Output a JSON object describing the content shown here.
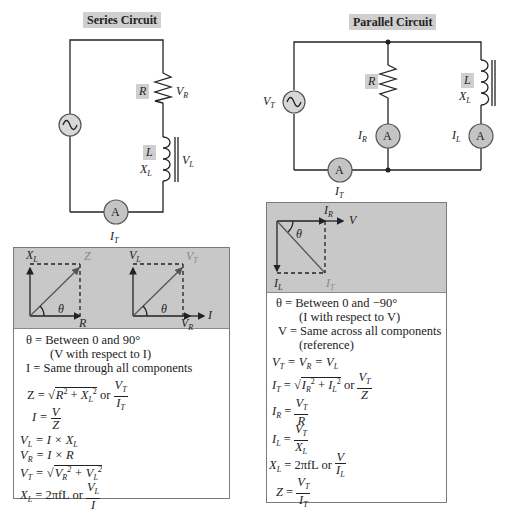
{
  "series": {
    "title": "Series Circuit",
    "labels": {
      "R": "R",
      "VR": "V",
      "VR_sub": "R",
      "L": "L",
      "XL": "X",
      "XL_sub": "L",
      "VL": "V",
      "VL_sub": "L",
      "ammeter": "A",
      "IT": "I",
      "IT_sub": "T"
    },
    "phasor_impedance": {
      "y_axis": "X",
      "y_axis_sub": "L",
      "x_axis": "R",
      "resultant": "Z",
      "angle": "θ"
    },
    "phasor_voltage": {
      "y_axis": "V",
      "y_axis_sub": "L",
      "x_axis": "V",
      "x_axis_sub": "R",
      "resultant": "V",
      "resultant_sub": "T",
      "reference": "I",
      "angle": "θ"
    },
    "equations": {
      "theta": "θ = Between 0 and 90°",
      "theta_note": "(V with respect to I)",
      "current": "I = Same through all components",
      "z_lhs": "Z =",
      "z_or": "or",
      "i_lhs": "I =",
      "vl": "V",
      "vr": "V",
      "vt_lhs": "V",
      "xl_lhs": "X",
      "xl_rhs": "= 2πfL or"
    }
  },
  "parallel": {
    "title": "Parallel Circuit",
    "labels": {
      "VT": "V",
      "VT_sub": "T",
      "R": "R",
      "IR": "I",
      "IR_sub": "R",
      "L": "L",
      "XL": "X",
      "XL_sub": "L",
      "IL": "I",
      "IL_sub": "L",
      "IT": "I",
      "IT_sub": "T",
      "ammeter": "A"
    },
    "phasor": {
      "reference": "V",
      "x_component": "I",
      "x_component_sub": "R",
      "y_component": "I",
      "y_component_sub": "L",
      "resultant": "I",
      "resultant_sub": "T",
      "angle": "θ"
    },
    "equations": {
      "theta": "θ = Between 0 and −90°",
      "theta_note": "(I with respect to V)",
      "voltage": "V = Same across all components",
      "voltage_note": "(reference)",
      "or": "or",
      "xl_rhs": "= 2πfL  or"
    }
  },
  "colors": {
    "label_bg": "#cfcfcf",
    "panel_gray": "#c8c8c8",
    "meter_fill": "#c4c4c4",
    "line": "#222222",
    "resultant_label": "#8a8a8a"
  }
}
